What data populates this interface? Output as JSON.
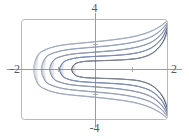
{
  "figure": {
    "kind": "contour-plot",
    "background_color": "#ffffff",
    "frame": {
      "name": "plot-frame",
      "color": "#b8b8bd",
      "x": 21,
      "y": 19,
      "width": 147,
      "height": 101,
      "corner_radius": 3
    },
    "axes": {
      "color": "#9a9a9f",
      "x_axis_y": 69,
      "y_axis_x": 95,
      "tick_color": "#9a9a9f"
    },
    "labels": {
      "top": "4",
      "bottom": "-4",
      "left": "-2",
      "right": "2"
    }
  },
  "chart_data": {
    "type": "line",
    "title": "",
    "xlabel": "",
    "ylabel": "",
    "xlim": [
      -2,
      2
    ],
    "ylim": [
      -4,
      4
    ],
    "xticks": [
      -2,
      2
    ],
    "yticks": [
      -4,
      4
    ],
    "grid": false,
    "legend": false,
    "series": [
      {
        "name": "level-curve-1-innermost",
        "color": "#2f2f33",
        "width": 0.9,
        "left_vertex_x": -0.62,
        "apex_y_top": 0.62,
        "apex_y_bottom": -0.62,
        "x": [
          -0.62,
          -0.55,
          -0.4,
          -0.18,
          0.1,
          0.45,
          0.85,
          1.25,
          1.58,
          1.82,
          1.95,
          2.0
        ],
        "y_upper": [
          0.0,
          0.4,
          0.58,
          0.66,
          0.69,
          0.72,
          0.78,
          0.92,
          1.3,
          2.0,
          2.8,
          3.55
        ],
        "y_lower": [
          0.0,
          -0.4,
          -0.58,
          -0.66,
          -0.69,
          -0.72,
          -0.78,
          -0.92,
          -1.3,
          -2.0,
          -2.8,
          -3.55
        ]
      },
      {
        "name": "level-curve-2",
        "color": "#3c5a96",
        "width": 0.9,
        "left_vertex_x": -0.95,
        "apex_y_top": 0.95,
        "apex_y_bottom": -0.95,
        "x": [
          -0.95,
          -0.86,
          -0.68,
          -0.4,
          -0.05,
          0.35,
          0.78,
          1.2,
          1.55,
          1.8,
          1.94,
          2.0
        ],
        "y_upper": [
          0.0,
          0.55,
          0.8,
          0.95,
          1.02,
          1.08,
          1.16,
          1.34,
          1.72,
          2.35,
          3.05,
          3.62
        ],
        "y_lower": [
          0.0,
          -0.55,
          -0.8,
          -0.95,
          -1.02,
          -1.08,
          -1.16,
          -1.34,
          -1.72,
          -2.35,
          -3.05,
          -3.62
        ]
      },
      {
        "name": "level-curve-3",
        "color": "#6f7a8c",
        "width": 0.85,
        "left_vertex_x": -1.22,
        "apex_y_top": 1.28,
        "apex_y_bottom": -1.28,
        "x": [
          -1.22,
          -1.12,
          -0.92,
          -0.6,
          -0.2,
          0.25,
          0.7,
          1.15,
          1.52,
          1.78,
          1.93,
          2.0
        ],
        "y_upper": [
          0.0,
          0.72,
          1.02,
          1.22,
          1.32,
          1.42,
          1.54,
          1.76,
          2.12,
          2.68,
          3.28,
          3.7
        ],
        "y_lower": [
          0.0,
          -0.72,
          -1.02,
          -1.22,
          -1.32,
          -1.42,
          -1.54,
          -1.76,
          -2.12,
          -2.68,
          -3.28,
          -3.7
        ]
      },
      {
        "name": "level-curve-4",
        "color": "#8f98a8",
        "width": 0.85,
        "left_vertex_x": -1.45,
        "apex_y_top": 1.62,
        "apex_y_bottom": -1.62,
        "x": [
          -1.45,
          -1.34,
          -1.12,
          -0.78,
          -0.34,
          0.14,
          0.62,
          1.08,
          1.48,
          1.76,
          1.92,
          2.0
        ],
        "y_upper": [
          0.0,
          0.92,
          1.3,
          1.54,
          1.68,
          1.8,
          1.94,
          2.16,
          2.5,
          3.0,
          3.48,
          3.78
        ],
        "y_lower": [
          0.0,
          -0.92,
          -1.3,
          -1.54,
          -1.68,
          -1.8,
          -1.94,
          -2.16,
          -2.5,
          -3.0,
          -3.48,
          -3.78
        ]
      },
      {
        "name": "level-curve-5-outermost",
        "color": "#a9b0bc",
        "width": 0.8,
        "left_vertex_x": -1.66,
        "apex_y_top": 1.98,
        "apex_y_bottom": -1.98,
        "x": [
          -1.66,
          -1.55,
          -1.32,
          -0.96,
          -0.5,
          0.02,
          0.52,
          1.02,
          1.44,
          1.74,
          1.91,
          2.0
        ],
        "y_upper": [
          0.0,
          1.12,
          1.58,
          1.88,
          2.04,
          2.18,
          2.34,
          2.56,
          2.9,
          3.32,
          3.68,
          3.9
        ],
        "y_lower": [
          0.0,
          -1.12,
          -1.58,
          -1.88,
          -2.04,
          -2.18,
          -2.34,
          -2.56,
          -2.9,
          -3.32,
          -3.68,
          -3.9
        ]
      }
    ]
  }
}
